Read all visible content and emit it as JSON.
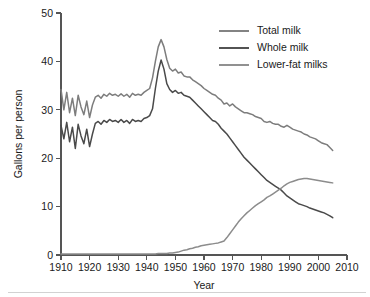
{
  "chart_data": {
    "type": "line",
    "title": "",
    "xlabel": "Year",
    "ylabel": "Gallons per person",
    "xlim": [
      1910,
      2010
    ],
    "ylim": [
      0,
      50
    ],
    "xticks": [
      1910,
      1920,
      1930,
      1940,
      1950,
      1960,
      1970,
      1980,
      1990,
      2000,
      2010
    ],
    "yticks": [
      0,
      10,
      20,
      30,
      40,
      50
    ],
    "grid": false,
    "legend_position": "top-right",
    "colors": {
      "total_milk": "#7d7d7d",
      "whole_milk": "#4a4a4a",
      "lower_fat_milks": "#8c8c8c",
      "axis": "#555555",
      "text": "#1a1a1a"
    },
    "x": [
      1910,
      1911,
      1912,
      1913,
      1914,
      1915,
      1916,
      1917,
      1918,
      1919,
      1920,
      1921,
      1922,
      1923,
      1924,
      1925,
      1926,
      1927,
      1928,
      1929,
      1930,
      1931,
      1932,
      1933,
      1934,
      1935,
      1936,
      1937,
      1938,
      1939,
      1940,
      1941,
      1942,
      1943,
      1944,
      1945,
      1946,
      1947,
      1948,
      1949,
      1950,
      1951,
      1952,
      1953,
      1954,
      1955,
      1956,
      1957,
      1958,
      1959,
      1960,
      1961,
      1962,
      1963,
      1964,
      1965,
      1966,
      1967,
      1968,
      1969,
      1970,
      1971,
      1972,
      1973,
      1974,
      1975,
      1976,
      1977,
      1978,
      1979,
      1980,
      1981,
      1982,
      1983,
      1984,
      1985,
      1986,
      1987,
      1988,
      1989,
      1990,
      1991,
      1992,
      1993,
      1994,
      1995,
      1996,
      1997,
      1998,
      1999,
      2000,
      2001,
      2002,
      2003,
      2004,
      2005
    ],
    "series": [
      {
        "name": "Total milk",
        "color": "#7d7d7d",
        "values": [
          34.2,
          30.0,
          33.6,
          29.4,
          32.4,
          28.8,
          33.0,
          30.6,
          29.0,
          31.8,
          28.4,
          31.0,
          32.6,
          33.0,
          32.4,
          33.2,
          32.8,
          33.4,
          33.0,
          33.2,
          32.8,
          33.3,
          32.8,
          33.2,
          32.6,
          33.4,
          33.0,
          33.2,
          33.0,
          33.6,
          34.0,
          34.4,
          36.6,
          40.0,
          43.0,
          44.5,
          43.0,
          40.4,
          38.6,
          38.0,
          38.4,
          37.6,
          37.8,
          37.0,
          36.8,
          36.8,
          36.2,
          35.8,
          35.4,
          35.0,
          34.4,
          34.0,
          33.6,
          33.2,
          33.0,
          32.4,
          32.0,
          31.2,
          31.4,
          30.8,
          31.2,
          30.6,
          30.2,
          29.8,
          29.4,
          29.4,
          29.2,
          29.0,
          28.6,
          28.4,
          28.2,
          27.6,
          27.4,
          27.6,
          27.2,
          27.0,
          27.0,
          26.6,
          26.4,
          26.8,
          26.4,
          26.0,
          25.8,
          25.6,
          25.4,
          25.0,
          24.8,
          24.4,
          24.2,
          24.0,
          23.6,
          23.2,
          23.0,
          22.8,
          22.2,
          21.6
        ]
      },
      {
        "name": "Whole milk",
        "color": "#4a4a4a",
        "values": [
          26.8,
          24.0,
          27.4,
          23.4,
          26.4,
          22.0,
          27.0,
          24.6,
          23.0,
          26.0,
          22.4,
          25.0,
          27.2,
          27.6,
          27.0,
          27.8,
          27.4,
          28.0,
          27.6,
          27.8,
          27.4,
          28.0,
          27.4,
          27.8,
          27.2,
          28.0,
          27.6,
          27.8,
          27.6,
          28.2,
          28.4,
          28.8,
          30.2,
          34.4,
          38.0,
          40.3,
          38.4,
          35.4,
          34.2,
          33.6,
          34.0,
          33.4,
          33.6,
          33.0,
          32.8,
          32.6,
          32.0,
          31.4,
          30.8,
          30.2,
          29.6,
          29.0,
          28.4,
          27.8,
          27.6,
          27.0,
          26.2,
          25.6,
          25.0,
          24.2,
          23.4,
          22.6,
          21.8,
          21.0,
          20.2,
          19.6,
          19.0,
          18.4,
          17.8,
          17.2,
          16.6,
          16.0,
          15.4,
          15.0,
          14.6,
          14.2,
          13.8,
          13.4,
          12.8,
          12.2,
          11.8,
          11.4,
          11.0,
          10.6,
          10.4,
          10.2,
          10.0,
          9.7,
          9.5,
          9.3,
          9.1,
          8.9,
          8.7,
          8.4,
          8.1,
          7.7
        ]
      },
      {
        "name": "Lower-fat milks",
        "color": "#8c8c8c",
        "values": [
          0.2,
          0.2,
          0.2,
          0.2,
          0.2,
          0.2,
          0.2,
          0.2,
          0.2,
          0.2,
          0.2,
          0.2,
          0.2,
          0.2,
          0.2,
          0.2,
          0.2,
          0.2,
          0.2,
          0.2,
          0.2,
          0.2,
          0.2,
          0.2,
          0.2,
          0.2,
          0.2,
          0.2,
          0.2,
          0.2,
          0.2,
          0.2,
          0.2,
          0.2,
          0.3,
          0.3,
          0.3,
          0.3,
          0.4,
          0.4,
          0.5,
          0.6,
          0.8,
          1.0,
          1.1,
          1.3,
          1.4,
          1.6,
          1.7,
          1.9,
          2.0,
          2.1,
          2.2,
          2.3,
          2.4,
          2.5,
          2.7,
          2.9,
          3.6,
          4.4,
          5.2,
          6.0,
          6.8,
          7.5,
          8.1,
          8.7,
          9.2,
          9.7,
          10.2,
          10.6,
          11.0,
          11.4,
          11.9,
          12.2,
          12.6,
          13.0,
          13.4,
          13.8,
          14.3,
          14.7,
          15.0,
          15.2,
          15.4,
          15.6,
          15.7,
          15.8,
          15.8,
          15.7,
          15.6,
          15.5,
          15.4,
          15.3,
          15.2,
          15.1,
          15.0,
          14.9
        ]
      }
    ]
  },
  "legend": {
    "items": [
      {
        "label": "Total milk"
      },
      {
        "label": "Whole milk"
      },
      {
        "label": "Lower-fat milks"
      }
    ]
  }
}
